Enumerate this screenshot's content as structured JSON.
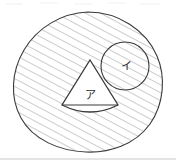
{
  "figure": {
    "caption_artifact": "",
    "background_color": "#ffffff",
    "ink_color": "#3a3a3a",
    "hatch_color": "#8d8d8d",
    "rule_color": "#c9c9c9",
    "labels": {
      "triangle": "ア",
      "small_circle": "イ"
    },
    "shapes": [
      {
        "name": "outer-blob",
        "kind": "blob",
        "shaded": true,
        "hatch": "diagonal-45-up-right",
        "bounds": {
          "x": 12,
          "y": 12,
          "width": 151,
          "height": 140
        }
      },
      {
        "name": "small-circle",
        "kind": "circle",
        "shaded": true,
        "label": "イ",
        "center": {
          "x": 125,
          "y": 66
        },
        "radius": 24
      },
      {
        "name": "rounded-triangle",
        "kind": "triangle-with-arc-base",
        "shaded": false,
        "label": "ア",
        "apex": {
          "x": 90,
          "y": 60
        },
        "base_left": {
          "x": 62,
          "y": 106
        },
        "base_right": {
          "x": 118,
          "y": 106
        }
      }
    ],
    "bottom_rule": {
      "y": 159,
      "x1": 0,
      "x2": 176
    }
  }
}
